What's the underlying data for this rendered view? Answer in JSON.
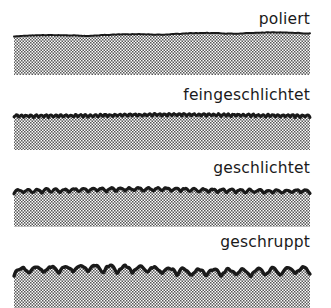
{
  "figure": {
    "background_color": "#ffffff",
    "ink_color": "#1a1a1a",
    "hatch_color": "#555555",
    "specimen_left_x": 14,
    "specimen_right_x": 310
  },
  "specimens": [
    {
      "label": "poliert",
      "roughness_rank": 1,
      "wave_amplitude": 1.2,
      "wave_count": 2,
      "line_thickness": 2.0,
      "body_height": 40,
      "description": "nahezu glatte, leicht gewellte Oberflaeche"
    },
    {
      "label": "feingeschlichtet",
      "roughness_rank": 2,
      "wave_amplitude": 2.4,
      "wave_count": 30,
      "line_thickness": 3.0,
      "body_height": 36,
      "description": "sehr feine, dichte Riefen"
    },
    {
      "label": "geschlichtet",
      "roughness_rank": 3,
      "wave_amplitude": 3.6,
      "wave_count": 16,
      "line_thickness": 3.2,
      "body_height": 38,
      "description": "mittlere Wellung"
    },
    {
      "label": "geschruppt",
      "roughness_rank": 4,
      "wave_amplitude": 7.0,
      "wave_count": 10,
      "line_thickness": 3.4,
      "body_height": 41,
      "description": "grobe, tiefe Schuppen"
    }
  ]
}
